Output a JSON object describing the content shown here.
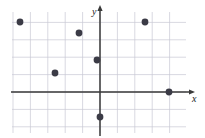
{
  "figure": {
    "type": "coordinate-plane-scatter",
    "width": 205,
    "height": 138,
    "background_color": "#ffffff"
  },
  "axes": {
    "x_label": "x",
    "y_label": "y",
    "axis_color": "#3a3a3a",
    "origin_px": {
      "x": 100,
      "y": 92
    },
    "cell_size_px": 17.4,
    "x_axis_y_px": 92,
    "y_axis_x_px": 100,
    "x_arrow": true,
    "y_arrow": true,
    "tick_labels": []
  },
  "grid": {
    "show": true,
    "color": "#c9c9d4",
    "line_width": 0.7,
    "left_px": 12,
    "right_px": 186,
    "top_px": 12,
    "bottom_px": 133,
    "columns": 10,
    "rows": 7
  },
  "chart_data": {
    "type": "scatter",
    "title": "",
    "xlabel": "x",
    "ylabel": "y",
    "xlim": [
      -5,
      5
    ],
    "ylim": [
      -3,
      4
    ],
    "grid": true,
    "legend": "none",
    "marker_color": "#3b3b46",
    "marker_radius_px": 3.4,
    "series": [
      {
        "name": "points",
        "points": [
          {
            "x": -5,
            "y": 4,
            "px": 20,
            "py": 22
          },
          {
            "x": -1,
            "y": 3,
            "px": 79,
            "py": 33
          },
          {
            "x": 2.6,
            "y": 4,
            "px": 145,
            "py": 22
          },
          {
            "x": -0.2,
            "y": 1.8,
            "px": 97,
            "py": 60
          },
          {
            "x": -2.6,
            "y": 1.1,
            "px": 55,
            "py": 73
          },
          {
            "x": 4,
            "y": 0,
            "px": 169,
            "py": 92
          },
          {
            "x": 0,
            "y": -1.4,
            "px": 100,
            "py": 117
          }
        ]
      }
    ]
  }
}
